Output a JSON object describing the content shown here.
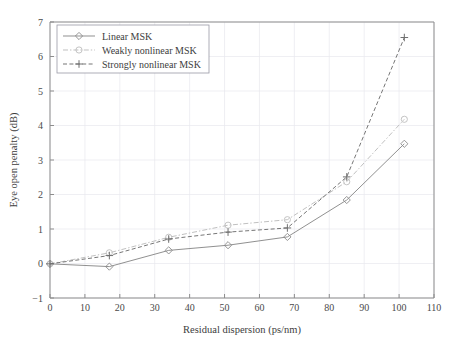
{
  "chart_data": {
    "type": "line",
    "title": "",
    "xlabel": "Residual dispersion (ps/nm)",
    "ylabel": "Eye open penalty (dB)",
    "xlim": [
      0,
      110
    ],
    "ylim": [
      -1,
      7
    ],
    "xticks": [
      0,
      10,
      20,
      30,
      40,
      50,
      60,
      70,
      80,
      90,
      100,
      110
    ],
    "yticks": [
      -1,
      0,
      1,
      2,
      3,
      4,
      5,
      6,
      7
    ],
    "xtick_labels": [
      "0",
      "10",
      "20",
      "30",
      "40",
      "50",
      "60",
      "70",
      "80",
      "90",
      "100",
      "110"
    ],
    "ytick_labels": [
      "−1",
      "0",
      "1",
      "2",
      "3",
      "4",
      "5",
      "6",
      "7"
    ],
    "grid": true,
    "legend_position": "upper left",
    "series": [
      {
        "name": "Linear MSK",
        "marker": "diamond",
        "linestyle": "solid",
        "color": "#8a8a8a",
        "x": [
          0,
          17,
          34,
          51,
          68,
          85,
          101.5
        ],
        "y": [
          -0.01,
          -0.09,
          0.38,
          0.53,
          0.77,
          1.84,
          3.47
        ]
      },
      {
        "name": "Weakly nonlinear MSK",
        "marker": "circle",
        "linestyle": "dashdot",
        "color": "#bdbdbd",
        "x": [
          0,
          17,
          34,
          51,
          68,
          85,
          101.5
        ],
        "y": [
          -0.01,
          0.31,
          0.76,
          1.11,
          1.27,
          2.37,
          4.18
        ]
      },
      {
        "name": "Strongly nonlinear MSK",
        "marker": "plus",
        "linestyle": "dashed",
        "color": "#6f6f6f",
        "x": [
          0,
          17,
          34,
          51,
          68,
          85,
          101.5
        ],
        "y": [
          -0.01,
          0.23,
          0.71,
          0.91,
          1.03,
          2.51,
          6.55
        ]
      }
    ]
  },
  "legend": {
    "items": [
      {
        "label": "Linear MSK"
      },
      {
        "label": "Weakly nonlinear MSK"
      },
      {
        "label": "Strongly nonlinear MSK"
      }
    ]
  },
  "colors": {
    "background": "#ffffff",
    "axis": "#8d8d8d",
    "grid": "#e8e8ee",
    "linear": "#8a8a8a",
    "weakly": "#bdbdbd",
    "strongly": "#6f6f6f"
  }
}
